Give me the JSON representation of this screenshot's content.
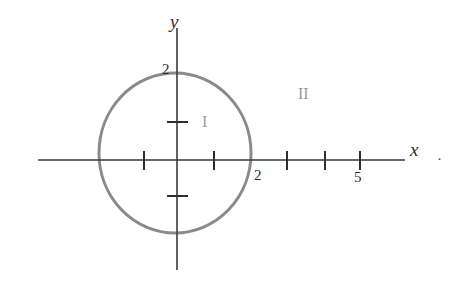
{
  "figure": {
    "background_color": "#ffffff",
    "axis_color": "#3a3a3a",
    "circle_color": "#8a8a8a",
    "region_label_color": "#9a9a9a",
    "text_color": "#2e2e2e"
  },
  "axes": {
    "x": {
      "name": "x",
      "line": {
        "x1": 38,
        "y1": 160,
        "x2": 405,
        "y2": 160
      },
      "tick_labels": [
        "2",
        "5"
      ],
      "ticks": [
        {
          "label": "",
          "x": 144,
          "value": -1
        },
        {
          "label": "",
          "x": 214,
          "value": 1
        },
        {
          "label": "2",
          "x": 251,
          "value": 2
        },
        {
          "label": "",
          "x": 287,
          "value": 3
        },
        {
          "label": "",
          "x": 325,
          "value": 4
        },
        {
          "label": "5",
          "x": 360,
          "value": 5
        }
      ]
    },
    "y": {
      "name": "y",
      "line": {
        "x1": 177,
        "y1": 28,
        "x2": 177,
        "y2": 270
      },
      "tick_labels": [
        "2"
      ],
      "ticks": [
        {
          "label": "",
          "y": 122,
          "value": 1
        },
        {
          "label": "2",
          "y": 76,
          "value": 2
        },
        {
          "label": "",
          "y": 196,
          "value": -1
        }
      ]
    },
    "origin": {
      "x": 177,
      "y": 160
    }
  },
  "circle": {
    "center_x": 175,
    "center_y": 153,
    "radius_x": 76,
    "radius_y": 80,
    "stroke_width": 3,
    "stroke_color": "#8a8a8a"
  },
  "labels": {
    "y_axis_name": "y",
    "x_axis_name": "x",
    "y_tick_two": "2",
    "x_tick_two": "2",
    "x_tick_five": "5",
    "region_inner": "I",
    "region_outer": "II",
    "trailing_dot": "·"
  },
  "chart_data": {
    "type": "scatter",
    "title": "",
    "xlabel": "x",
    "ylabel": "y",
    "xlim": [
      -3.7,
      6.2
    ],
    "ylim": [
      -3.0,
      3.6
    ],
    "grid": false,
    "legend": null,
    "x_ticks": [
      -1,
      1,
      2,
      3,
      4,
      5
    ],
    "x_tick_labels": [
      "",
      "",
      "2",
      "",
      "",
      "5"
    ],
    "y_ticks": [
      -1,
      1,
      2
    ],
    "y_tick_labels": [
      "",
      "",
      "2"
    ],
    "annotations": [
      {
        "text": "I",
        "x": 0.8,
        "y": 1.0,
        "color": "#9a9a9a"
      },
      {
        "text": "II",
        "x": 3.5,
        "y": 1.75,
        "color": "#9a9a9a"
      }
    ],
    "shapes": [
      {
        "kind": "circle",
        "center": [
          0,
          0
        ],
        "radius": 2,
        "filled": false,
        "edge_color": "#8a8a8a",
        "line_width": 3
      }
    ]
  }
}
